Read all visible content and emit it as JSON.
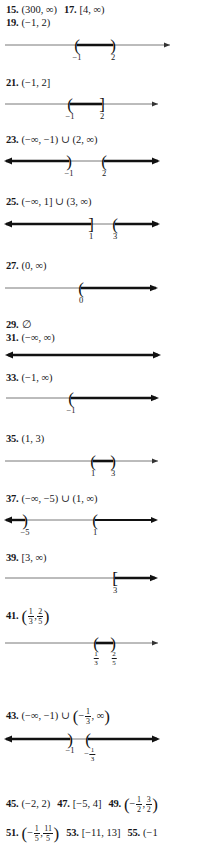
{
  "document": {
    "kind": "textbook-answer-key",
    "subject": "interval-notation-and-number-line-graphs"
  },
  "answers": [
    {
      "id": "a15",
      "number": "15.",
      "expression": "(300, ∞)",
      "second_number": "17.",
      "second_expression": "[4, ∞)"
    },
    {
      "id": "a19",
      "number": "19.",
      "expression": "(−1, 2)"
    },
    {
      "id": "a21",
      "number": "21.",
      "expression": "(−1, 2]"
    },
    {
      "id": "a23",
      "number": "23.",
      "expression": "(−∞, −1) ∪ (2, ∞)"
    },
    {
      "id": "a25",
      "number": "25.",
      "expression": "(−∞, 1] ∪ (3, ∞)"
    },
    {
      "id": "a27",
      "number": "27.",
      "expression": "(0, ∞)"
    },
    {
      "id": "a29",
      "number": "29.",
      "expression": "∅"
    },
    {
      "id": "a31",
      "number": "31.",
      "expression": "(−∞, ∞)"
    },
    {
      "id": "a33",
      "number": "33.",
      "expression": "(−1, ∞)"
    },
    {
      "id": "a35",
      "number": "35.",
      "expression": "(1, 3)"
    },
    {
      "id": "a37",
      "number": "37.",
      "expression": "(−∞, −5) ∪ (1, ∞)"
    },
    {
      "id": "a39",
      "number": "39.",
      "expression": "[3, ∞)"
    },
    {
      "id": "a41",
      "number": "41.",
      "expression_prefix": "(",
      "expression_suffix": ")",
      "fraction_a_num": "1",
      "fraction_a_den": "3",
      "separator": ",",
      "fraction_b_num": "2",
      "fraction_b_den": "5"
    },
    {
      "id": "a43",
      "number": "43.",
      "expression_lead": "(−∞, −1) ∪",
      "paren_open": "(",
      "minus": "−",
      "fraction_num": "1",
      "fraction_den": "3",
      "tail": ", ∞",
      "paren_close": ")"
    },
    {
      "id": "a45",
      "number": "45.",
      "expression": "(−2, 2)",
      "second_number": "47.",
      "second_expression": "[−5, 4]",
      "third_number": "49.",
      "third_paren_open": "(",
      "third_minus": "−",
      "third_frac_a_num": "1",
      "third_frac_a_den": "2",
      "third_sep": ",",
      "third_frac_b_num": "3",
      "third_frac_b_den": "2",
      "third_paren_close": ")"
    },
    {
      "id": "a51",
      "number": "51.",
      "paren_open": "(",
      "minus": "−",
      "frac_a_num": "1",
      "frac_a_den": "5",
      "sep": ",",
      "frac_b_num": "11",
      "frac_b_den": "5",
      "paren_close": ")",
      "second_number": "53.",
      "second_expression": "[−11, 13]",
      "third_number": "55.",
      "third_expression": "(−1"
    }
  ],
  "numberlines": [
    {
      "id": "nl19",
      "for": "19",
      "labels": [
        {
          "text": "−1",
          "x": 77
        },
        {
          "text": "2",
          "x": 113
        }
      ]
    },
    {
      "id": "nl21",
      "for": "21",
      "labels": [
        {
          "text": "−1",
          "x": 70
        },
        {
          "text": "2",
          "x": 102
        }
      ]
    },
    {
      "id": "nl23",
      "for": "23",
      "labels": [
        {
          "text": "−1",
          "x": 69
        },
        {
          "text": "2",
          "x": 104
        }
      ]
    },
    {
      "id": "nl25",
      "for": "25",
      "labels": [
        {
          "text": "1",
          "x": 91
        },
        {
          "text": "3",
          "x": 115
        }
      ]
    },
    {
      "id": "nl27",
      "for": "27",
      "labels": [
        {
          "text": "0",
          "x": 81
        }
      ]
    },
    {
      "id": "nl31",
      "for": "31",
      "labels": []
    },
    {
      "id": "nl33",
      "for": "33",
      "labels": [
        {
          "text": "−1",
          "x": 71
        }
      ]
    },
    {
      "id": "nl35",
      "for": "35",
      "labels": [
        {
          "text": "1",
          "x": 93
        },
        {
          "text": "3",
          "x": 113
        }
      ]
    },
    {
      "id": "nl37",
      "for": "37",
      "labels": [
        {
          "text": "−5",
          "x": 25
        },
        {
          "text": "1",
          "x": 95
        }
      ]
    },
    {
      "id": "nl39",
      "for": "39",
      "labels": [
        {
          "text": "3",
          "x": 115
        }
      ]
    },
    {
      "id": "nl41",
      "for": "41",
      "frac_labels": [
        {
          "num": "1",
          "den": "3",
          "x": 96
        },
        {
          "num": "2",
          "den": "5",
          "x": 113
        }
      ]
    },
    {
      "id": "nl43",
      "for": "43",
      "labels": [
        {
          "text": "−1",
          "x": 70
        }
      ],
      "frac_labels": [
        {
          "num": "1",
          "den": "3",
          "x": 88,
          "minus": "−"
        }
      ]
    }
  ]
}
